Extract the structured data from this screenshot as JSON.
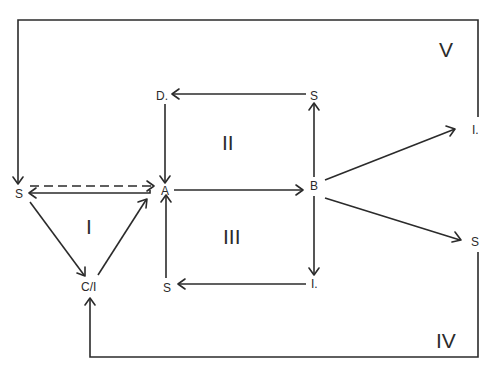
{
  "nodes": {
    "s_left": "S",
    "a": "A",
    "b": "B",
    "d": "D.",
    "s_top": "S",
    "i_right": "I.",
    "s_right": "S",
    "c_i": "C/I",
    "s_bottom": "S",
    "i_bottom": "I."
  },
  "regions": {
    "r1": "I",
    "r2": "II",
    "r3": "III",
    "r4": "IV",
    "r5": "V"
  },
  "colors": {
    "line": "#2b2b2b",
    "background": "#ffffff"
  },
  "edges": [
    {
      "from": "S",
      "to": "A",
      "style": "dashed"
    },
    {
      "from": "A",
      "to": "S",
      "style": "solid"
    },
    {
      "from": "S",
      "to": "C/I",
      "style": "solid"
    },
    {
      "from": "C/I",
      "to": "A",
      "style": "solid"
    },
    {
      "from": "A",
      "to": "B",
      "style": "solid"
    },
    {
      "from": "B",
      "to": "S (top)",
      "style": "solid"
    },
    {
      "from": "S (top)",
      "to": "D.",
      "style": "solid"
    },
    {
      "from": "D.",
      "to": "A",
      "style": "solid"
    },
    {
      "from": "B",
      "to": "I. (bottom)",
      "style": "solid"
    },
    {
      "from": "I. (bottom)",
      "to": "S (bottom)",
      "style": "solid"
    },
    {
      "from": "S (bottom)",
      "to": "A",
      "style": "solid"
    },
    {
      "from": "B",
      "to": "I. (right)",
      "style": "solid"
    },
    {
      "from": "B",
      "to": "S (right)",
      "style": "solid"
    },
    {
      "from": "I. (right)",
      "to": "S (left)",
      "style": "solid",
      "via": "top loop V"
    },
    {
      "from": "S (right)",
      "to": "C/I",
      "style": "solid",
      "via": "bottom loop IV"
    }
  ]
}
